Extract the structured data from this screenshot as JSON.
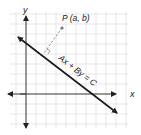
{
  "diagram": {
    "type": "coordinate-plane",
    "axes": {
      "x_label": "x",
      "y_label": "y"
    },
    "point": {
      "label": "P (a, b)"
    },
    "line": {
      "equation": "Ax + By = C"
    },
    "perpendicular": {
      "style": "dashed",
      "right_angle_marker": true
    },
    "colors": {
      "grid": "#d8d8d8",
      "axis": "#333333",
      "line": "#1a1a1a",
      "dashed": "#888888",
      "point": "#777777"
    }
  }
}
